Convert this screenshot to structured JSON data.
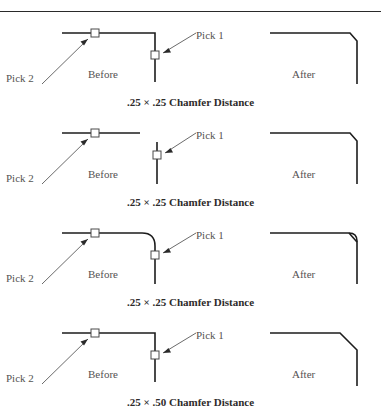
{
  "figure": {
    "labels": {
      "before": "Before",
      "after": "After",
      "pick1": "Pick 1",
      "pick2": "Pick 2"
    },
    "colors": {
      "line": "#1d1d1d",
      "label_text": "#555252",
      "caption_text": "#2e2b2b",
      "rule": "#2a2a2a",
      "pick_box_fill": "#ffffff",
      "leader": "#6b6b6b"
    },
    "panels": [
      {
        "index": 1,
        "caption": ".25 × .25 Chamfer Distance",
        "before_state": "corner-connected",
        "after_state": "small-chamfer"
      },
      {
        "index": 2,
        "caption": ".25 × .25 Chamfer Distance",
        "before_state": "lines-not-touching",
        "after_state": "small-chamfer"
      },
      {
        "index": 3,
        "caption": ".25 × .25 Chamfer Distance",
        "before_state": "filleted-corner",
        "after_state": "chamfer-over-arc"
      },
      {
        "index": 4,
        "caption": ".25 × .50 Chamfer Distance",
        "before_state": "corner-connected",
        "after_state": "large-chamfer"
      }
    ]
  }
}
